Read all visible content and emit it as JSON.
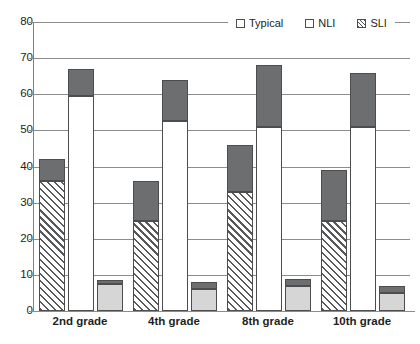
{
  "chart_data": {
    "type": "bar",
    "title": "",
    "subtitle": "",
    "xlabel": "",
    "ylabel": "",
    "ylim": [
      0,
      80
    ],
    "yticks": [
      0,
      10,
      20,
      30,
      40,
      50,
      60,
      70,
      80
    ],
    "ytick_labels": [
      "0",
      "10",
      "20",
      "30",
      "40",
      "50",
      "60",
      "70",
      "80"
    ],
    "grid": true,
    "stacked": true,
    "legend_position": "top-right",
    "categories": [
      "2nd grade",
      "4th grade",
      "8th grade",
      "10th grade"
    ],
    "group_order": [
      "SLI",
      "NLI",
      "Typical"
    ],
    "series": [
      {
        "name": "SLI",
        "fill": "diagonal-hatch",
        "values": [
          36,
          25,
          33,
          25
        ],
        "totals": [
          42,
          36,
          46,
          39
        ],
        "top_values": [
          6,
          11,
          13,
          14
        ]
      },
      {
        "name": "NLI",
        "fill": "white",
        "values": [
          59.5,
          52.5,
          51,
          51
        ],
        "totals": [
          67,
          64,
          68,
          66
        ],
        "top_values": [
          7.5,
          11.5,
          17,
          15
        ]
      },
      {
        "name": "Typical",
        "fill": "light-gray",
        "values": [
          7.5,
          6,
          7,
          5
        ],
        "totals": [
          8.5,
          8,
          9,
          7
        ],
        "top_values": [
          1,
          2,
          2,
          2
        ]
      }
    ],
    "top_segment_fill": "dark-gray",
    "colors": {
      "hatch_stroke": "#58595b",
      "white_fill": "#ffffff",
      "light_gray_fill": "#d6d6d6",
      "dark_gray_fill": "#6d6e70",
      "outline": "#4d4d4d",
      "gridline": "#8c8c8c",
      "text": "#231f20"
    }
  },
  "legend": {
    "entries": [
      {
        "label": "Typical",
        "swatch": "white-square"
      },
      {
        "label": "NLI",
        "swatch": "white-square"
      },
      {
        "label": "SLI",
        "swatch": "hatched-square"
      }
    ]
  }
}
